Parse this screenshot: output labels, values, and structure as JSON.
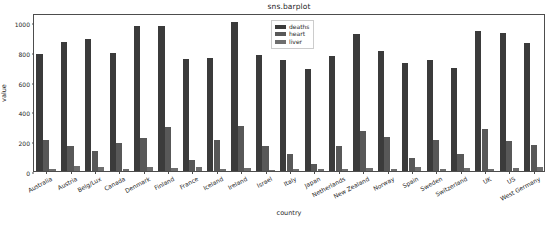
{
  "chart_data": {
    "type": "bar",
    "title": "sns.barplot",
    "xlabel": "country",
    "ylabel": "value",
    "ylim": [
      0,
      1060
    ],
    "yticks": [
      0,
      200,
      400,
      600,
      800,
      1000
    ],
    "grid": false,
    "legend_position": "upper center",
    "categories": [
      "Australia",
      "Austria",
      "Belg/Lux",
      "Canada",
      "Denmark",
      "Finland",
      "France",
      "Iceland",
      "Ireland",
      "Israel",
      "Italy",
      "Japan",
      "Netherlands",
      "New Zealand",
      "Norway",
      "Spain",
      "Sweden",
      "Switzerland",
      "UK",
      "US",
      "West Germany"
    ],
    "series": [
      {
        "name": "deaths",
        "color": "#3b3b3b",
        "values": [
          785,
          863,
          883,
          793,
          971,
          970,
          751,
          755,
          1000,
          775,
          743,
          683,
          773,
          916,
          806,
          724,
          743,
          693,
          941,
          926,
          861
        ]
      },
      {
        "name": "heart",
        "color": "#585858",
        "values": [
          211,
          167,
          131,
          191,
          220,
          297,
          71,
          211,
          300,
          167,
          112,
          45,
          167,
          266,
          227,
          86,
          207,
          115,
          285,
          199,
          172
        ]
      },
      {
        "name": "liver",
        "color": "#6e6e6e",
        "values": [
          15.3,
          31.4,
          24.7,
          16.3,
          23.9,
          19.0,
          24.0,
          10.8,
          18.9,
          10.0,
          15.3,
          15.6,
          11.3,
          18.6,
          11.4,
          23.7,
          11.2,
          18.7,
          10.2,
          17.6,
          30.0
        ]
      }
    ]
  },
  "legend": {
    "items": [
      {
        "label": "deaths"
      },
      {
        "label": "heart"
      },
      {
        "label": "liver"
      }
    ]
  }
}
